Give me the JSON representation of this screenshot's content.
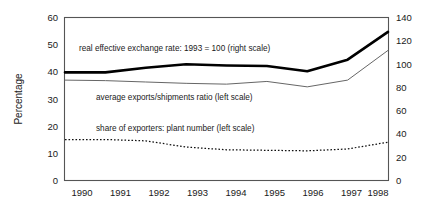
{
  "chart_data": {
    "type": "line",
    "title": "",
    "xlabel": "",
    "ylabel": "Percentage",
    "y2label": "",
    "grid": false,
    "legend_position": "inline-annotations",
    "x": [
      1990,
      1991,
      1992,
      1993,
      1994,
      1995,
      1996,
      1997,
      1998
    ],
    "xtick_labels": [
      "1990",
      "1991",
      "1992",
      "1993",
      "1994",
      "1995",
      "1996",
      "1997",
      "1998"
    ],
    "ylim": [
      0,
      60
    ],
    "ytick_labels": [
      "0",
      "10",
      "20",
      "30",
      "40",
      "50",
      "60"
    ],
    "yticks": [
      0,
      10,
      20,
      30,
      40,
      50,
      60
    ],
    "y2lim": [
      0,
      140
    ],
    "y2tick_labels": [
      "0",
      "20",
      "40",
      "60",
      "80",
      "100",
      "120",
      "140"
    ],
    "y2ticks": [
      0,
      20,
      40,
      60,
      80,
      100,
      120,
      140
    ],
    "series": [
      {
        "name": "real effective exchange rate: 1993 = 100 (right scale)",
        "axis": "right",
        "style": "thick-solid",
        "color": "#000000",
        "values": [
          93,
          93,
          97,
          100,
          99,
          98.5,
          94,
          104,
          128
        ]
      },
      {
        "name": "average exports/shipments ratio (left scale)",
        "axis": "left",
        "style": "thin-solid",
        "color": "#666666",
        "values": [
          37.0,
          36.8,
          36.3,
          35.8,
          35.5,
          36.5,
          34.5,
          37.0,
          48.0
        ]
      },
      {
        "name": "share of exporters: plant number (left scale)",
        "axis": "left",
        "style": "dotted",
        "color": "#111111",
        "values": [
          15.0,
          15.0,
          14.5,
          12.2,
          11.2,
          11.0,
          10.8,
          11.5,
          14.0
        ]
      }
    ],
    "annotations": [
      {
        "text": "real effective exchange rate: 1993 = 100 (right scale)",
        "x_px": 79,
        "y_px": 51
      },
      {
        "text": "average exports/shipments ratio (left scale)",
        "x_px": 96,
        "y_px": 100
      },
      {
        "text": "share of exporters: plant number (left scale)",
        "x_px": 96,
        "y_px": 131
      }
    ]
  }
}
